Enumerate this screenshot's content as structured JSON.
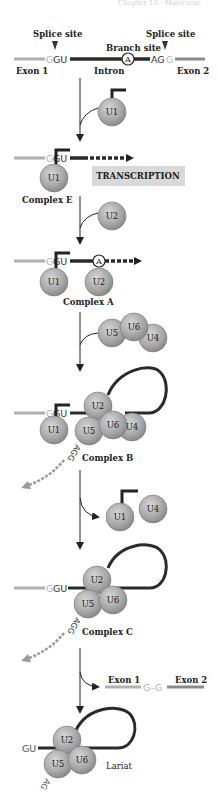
{
  "header": {
    "partial_text": "Chapter 13 · Molecular"
  },
  "colors": {
    "exon": "#b0b0b0",
    "intron": "#2a2a2a",
    "snrnp_fill": "#a8a8a8",
    "snrnp_stroke": "#6e6e6e",
    "transcription_box": "#d9d9d9",
    "excised_arrow": "#9a9a9a"
  },
  "pre_mrna": {
    "splice_site_left": "Splice site",
    "splice_site_right": "Splice site",
    "branch_site": "Branch site",
    "branch_nucleotide": "A",
    "exon1": "Exon 1",
    "intron": "Intron",
    "exon2": "Exon 2",
    "seq_5_g": "G",
    "seq_5_gu": "GU",
    "seq_3_ag": "AG",
    "seq_3_g": "G"
  },
  "snrnps": {
    "u1": "U1",
    "u2": "U2",
    "u4": "U4",
    "u5": "U5",
    "u6": "U6"
  },
  "transcription_label": "TRANSCRIPTION",
  "complexes": {
    "e": "Complex E",
    "a": "Complex A",
    "b": "Complex B",
    "c": "Complex C",
    "lariat": "Lariat"
  },
  "excised_seq": {
    "agg": "AGG",
    "ag": "AG",
    "gu": "GU"
  },
  "product": {
    "exon1": "Exon 1",
    "junction": "G–G",
    "exon2": "Exon 2"
  }
}
